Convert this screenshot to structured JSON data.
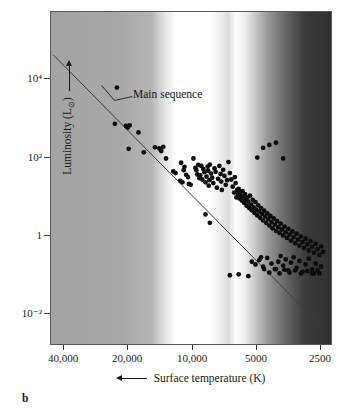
{
  "panel": {
    "caption": "b"
  },
  "axes": {
    "y": {
      "title": "Luminosity (L",
      "title_sub": "⊙",
      "title_suffix": ")",
      "arrow_icon": "arrow-up-icon",
      "ticks": [
        {
          "label": "10⁴",
          "value": 10000,
          "y_px": 78
        },
        {
          "label": "10²",
          "value": 100,
          "y_px": 157
        },
        {
          "label": "1",
          "value": 1,
          "y_px": 235
        },
        {
          "label": "10⁻²",
          "value": 0.01,
          "y_px": 313
        }
      ]
    },
    "x": {
      "title": "Surface temperature (K)",
      "arrow_icon": "arrow-left-icon",
      "ticks": [
        {
          "label": "40,000",
          "value": 40000,
          "x_px": 63
        },
        {
          "label": "20,000",
          "value": 20000,
          "x_px": 127
        },
        {
          "label": "10,000",
          "value": 10000,
          "x_px": 192
        },
        {
          "label": "5000",
          "value": 5000,
          "x_px": 256
        },
        {
          "label": "2500",
          "value": 2500,
          "x_px": 320
        }
      ]
    }
  },
  "annotations": [
    {
      "label": "Main sequence",
      "text_x": 133,
      "text_y": 88,
      "leader": [
        [
          132,
          96
        ],
        [
          114,
          100
        ],
        [
          101,
          85
        ]
      ]
    }
  ],
  "colors": {
    "point": "#0d0d0d",
    "main_sequence_line": "#3a3d40",
    "frame": "#55585c",
    "text": "#1a1a1a",
    "bg_hot": "#a3a3a3",
    "bg_white": "#fefefe",
    "bg_warm": "#d0d0d0",
    "bg_cool": "#3a3a3a"
  },
  "chart_data": {
    "type": "scatter",
    "title": "",
    "subtitle": "",
    "xlabel": "Surface temperature (K)",
    "ylabel": "Luminosity (L⊙)",
    "xscale": "log-reversed",
    "yscale": "log",
    "xlim": [
      45000,
      2200
    ],
    "ylim": [
      0.0012,
      70000
    ],
    "grid": false,
    "legend": null,
    "xtick_labels": [
      "40,000",
      "20,000",
      "10,000",
      "5000",
      "2500"
    ],
    "xtick_values": [
      40000,
      20000,
      10000,
      5000,
      2500
    ],
    "ytick_labels": [
      "10⁴",
      "10²",
      "1",
      "10⁻²"
    ],
    "ytick_values": [
      10000,
      100,
      1,
      0.01
    ],
    "series": [
      {
        "name": "Main sequence fit line",
        "type": "line",
        "points": [
          [
            45000,
            42000
          ],
          [
            2350,
            0.0035
          ]
        ]
      },
      {
        "name": "Stars",
        "type": "scatter",
        "marker": "filled-circle",
        "note": "Nearby + bright stars plotted on the H-R diagram; points given as [temperature_K, luminosity_Lsun]",
        "points": [
          [
            22500,
            6000
          ],
          [
            23000,
            700
          ],
          [
            20400,
            620
          ],
          [
            20000,
            560
          ],
          [
            19600,
            640
          ],
          [
            19800,
            160
          ],
          [
            17800,
            420
          ],
          [
            16800,
            130
          ],
          [
            14900,
            175
          ],
          [
            14200,
            165
          ],
          [
            14000,
            150
          ],
          [
            13900,
            140
          ],
          [
            13600,
            180
          ],
          [
            13200,
            90
          ],
          [
            12200,
            42
          ],
          [
            11900,
            38
          ],
          [
            11300,
            24
          ],
          [
            11050,
            22
          ],
          [
            11200,
            70
          ],
          [
            10800,
            55
          ],
          [
            10600,
            34
          ],
          [
            10400,
            30
          ],
          [
            10900,
            45
          ],
          [
            10300,
            20
          ],
          [
            10100,
            19
          ],
          [
            9800,
            90
          ],
          [
            9600,
            52
          ],
          [
            9500,
            45
          ],
          [
            9400,
            35
          ],
          [
            9300,
            62
          ],
          [
            9200,
            28
          ],
          [
            9100,
            33
          ],
          [
            9000,
            58
          ],
          [
            8900,
            26
          ],
          [
            8800,
            48
          ],
          [
            8700,
            40
          ],
          [
            8600,
            22
          ],
          [
            8500,
            31
          ],
          [
            8400,
            56
          ],
          [
            8350,
            44
          ],
          [
            8300,
            18
          ],
          [
            8250,
            25
          ],
          [
            8200,
            63
          ],
          [
            8100,
            37
          ],
          [
            8000,
            29
          ],
          [
            7900,
            21
          ],
          [
            7800,
            50
          ],
          [
            7700,
            41
          ],
          [
            7600,
            16
          ],
          [
            7500,
            27
          ],
          [
            7400,
            58
          ],
          [
            7300,
            36
          ],
          [
            7250,
            23
          ],
          [
            7200,
            14
          ],
          [
            7100,
            46
          ],
          [
            7000,
            32
          ],
          [
            6900,
            19
          ],
          [
            6800,
            25
          ],
          [
            8600,
            3.3
          ],
          [
            8200,
            2.0
          ],
          [
            6700,
            73
          ],
          [
            6600,
            38
          ],
          [
            6500,
            26
          ],
          [
            6400,
            17
          ],
          [
            6300,
            12
          ],
          [
            6250,
            30
          ],
          [
            6200,
            21
          ],
          [
            6150,
            9
          ],
          [
            6100,
            14
          ],
          [
            6050,
            11
          ],
          [
            6000,
            15
          ],
          [
            5950,
            8.5
          ],
          [
            5900,
            12.5
          ],
          [
            5850,
            10
          ],
          [
            5800,
            7.5
          ],
          [
            5750,
            13
          ],
          [
            5700,
            9.5
          ],
          [
            5650,
            6.5
          ],
          [
            5600,
            11
          ],
          [
            5550,
            8
          ],
          [
            5500,
            5.5
          ],
          [
            5450,
            9
          ],
          [
            5400,
            7
          ],
          [
            5350,
            4.8
          ],
          [
            5300,
            10
          ],
          [
            5250,
            6
          ],
          [
            5200,
            4.2
          ],
          [
            5150,
            7.8
          ],
          [
            5100,
            5
          ],
          [
            5050,
            3.6
          ],
          [
            5000,
            6.8
          ],
          [
            4950,
            4.4
          ],
          [
            4900,
            3.1
          ],
          [
            4850,
            5.6
          ],
          [
            4800,
            3.9
          ],
          [
            4750,
            2.7
          ],
          [
            4700,
            4.8
          ],
          [
            4650,
            3.4
          ],
          [
            4600,
            2.3
          ],
          [
            4550,
            4.1
          ],
          [
            4500,
            2.9
          ],
          [
            4450,
            2.0
          ],
          [
            4400,
            3.5
          ],
          [
            4350,
            2.5
          ],
          [
            4300,
            1.7
          ],
          [
            4250,
            3.0
          ],
          [
            4200,
            2.1
          ],
          [
            4150,
            1.45
          ],
          [
            4100,
            2.6
          ],
          [
            4050,
            1.8
          ],
          [
            4000,
            1.25
          ],
          [
            3950,
            2.2
          ],
          [
            3900,
            1.55
          ],
          [
            3850,
            1.1
          ],
          [
            3800,
            1.9
          ],
          [
            3750,
            1.35
          ],
          [
            3700,
            0.95
          ],
          [
            3650,
            1.6
          ],
          [
            3600,
            1.15
          ],
          [
            3550,
            0.82
          ],
          [
            3500,
            1.4
          ],
          [
            3450,
            1.0
          ],
          [
            3400,
            0.7
          ],
          [
            3350,
            1.2
          ],
          [
            3300,
            0.86
          ],
          [
            3250,
            0.6
          ],
          [
            3200,
            1.05
          ],
          [
            3150,
            0.74
          ],
          [
            3100,
            0.52
          ],
          [
            3050,
            0.9
          ],
          [
            3000,
            0.64
          ],
          [
            2950,
            0.45
          ],
          [
            2900,
            0.78
          ],
          [
            2850,
            0.56
          ],
          [
            2800,
            0.39
          ],
          [
            2750,
            0.68
          ],
          [
            2700,
            0.48
          ],
          [
            2650,
            0.34
          ],
          [
            2600,
            0.58
          ],
          [
            2550,
            0.42
          ],
          [
            2500,
            0.3
          ],
          [
            2450,
            0.5
          ],
          [
            2400,
            0.36
          ],
          [
            5200,
            0.2
          ],
          [
            5000,
            0.17
          ],
          [
            4800,
            0.22
          ],
          [
            4600,
            0.15
          ],
          [
            4400,
            0.25
          ],
          [
            4200,
            0.18
          ],
          [
            4000,
            0.13
          ],
          [
            3900,
            0.2
          ],
          [
            3800,
            0.28
          ],
          [
            3700,
            0.16
          ],
          [
            3600,
            0.23
          ],
          [
            3500,
            0.12
          ],
          [
            3400,
            0.19
          ],
          [
            3300,
            0.26
          ],
          [
            3200,
            0.14
          ],
          [
            3100,
            0.21
          ],
          [
            3000,
            0.11
          ],
          [
            2900,
            0.17
          ],
          [
            2800,
            0.24
          ],
          [
            2700,
            0.13
          ],
          [
            2600,
            0.18
          ],
          [
            2500,
            0.1
          ],
          [
            2450,
            0.15
          ],
          [
            6600,
            0.09
          ],
          [
            6000,
            0.095
          ],
          [
            5400,
            0.085
          ],
          [
            4700,
            0.26
          ],
          [
            4550,
            0.13
          ],
          [
            4300,
            0.105
          ],
          [
            4050,
            0.13
          ],
          [
            3850,
            0.1
          ],
          [
            3650,
            0.125
          ],
          [
            3450,
            0.105
          ],
          [
            3250,
            0.12
          ],
          [
            3050,
            0.1
          ],
          [
            2850,
            0.115
          ],
          [
            2650,
            0.1
          ],
          [
            4600,
            170
          ],
          [
            4300,
            200
          ],
          [
            4000,
            230
          ],
          [
            3700,
            90
          ],
          [
            4900,
            95
          ],
          [
            2700,
            0.1
          ],
          [
            2550,
            0.12
          ]
        ]
      }
    ]
  }
}
